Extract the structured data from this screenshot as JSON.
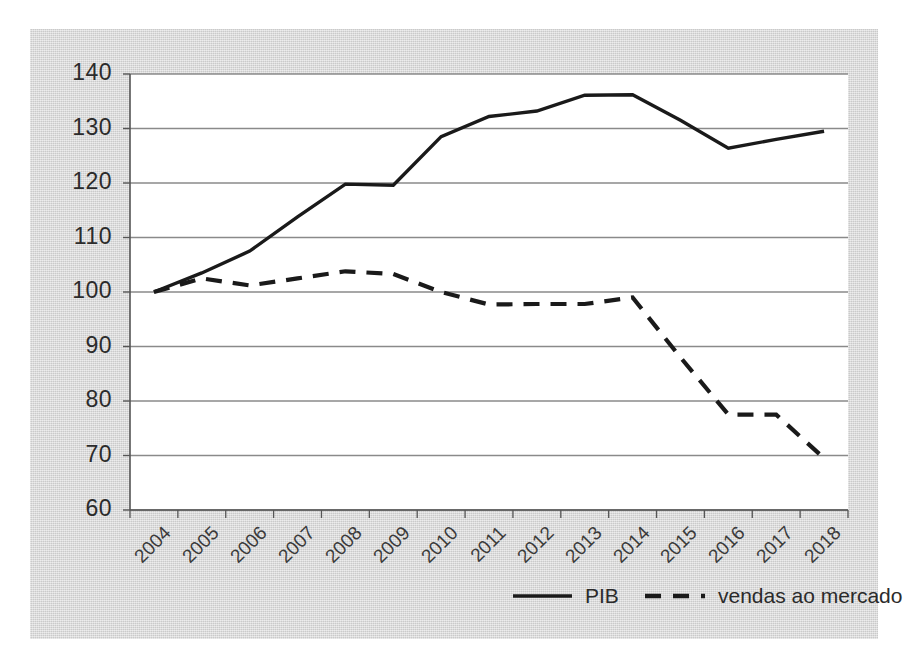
{
  "chart_data": {
    "type": "line",
    "title": "",
    "subtitle": "",
    "xlabel": "",
    "ylabel": "",
    "categories": [
      "2004",
      "2005",
      "2006",
      "2007",
      "2008",
      "2009",
      "2010",
      "2011",
      "2012",
      "2013",
      "2014",
      "2015",
      "2016",
      "2017",
      "2018"
    ],
    "series": [
      {
        "name": "PIB",
        "style": "solid",
        "color": "#1a1a1a",
        "values": [
          100,
          103.5,
          107.5,
          113.8,
          119.8,
          119.6,
          128.5,
          132.2,
          133.2,
          136.1,
          136.2,
          131.5,
          126.4,
          128.0,
          129.5
        ]
      },
      {
        "name": "vendas ao mercado",
        "style": "dashed",
        "color": "#1a1a1a",
        "values": [
          100,
          102.5,
          101.2,
          102.5,
          103.8,
          103.3,
          100.0,
          97.7,
          97.8,
          97.8,
          99.0,
          88.0,
          77.5,
          77.5,
          69.5
        ]
      }
    ],
    "ylim": [
      60,
      140
    ],
    "yticks": [
      60,
      70,
      80,
      90,
      100,
      110,
      120,
      130,
      140
    ],
    "ytick_labels": [
      "60",
      "70",
      "80",
      "90",
      "100",
      "110",
      "120",
      "130",
      "140"
    ],
    "grid": true,
    "grid_axis": "y",
    "legend_position": "bottom",
    "background_color": "#d6d6d6",
    "plot_background_color": "#ffffff",
    "gridline_color": "#8a8a8a",
    "axis_color": "#555555"
  },
  "legend": {
    "items": [
      {
        "label": "PIB",
        "style": "solid"
      },
      {
        "label": "vendas ao mercado",
        "style": "dashed"
      }
    ]
  }
}
